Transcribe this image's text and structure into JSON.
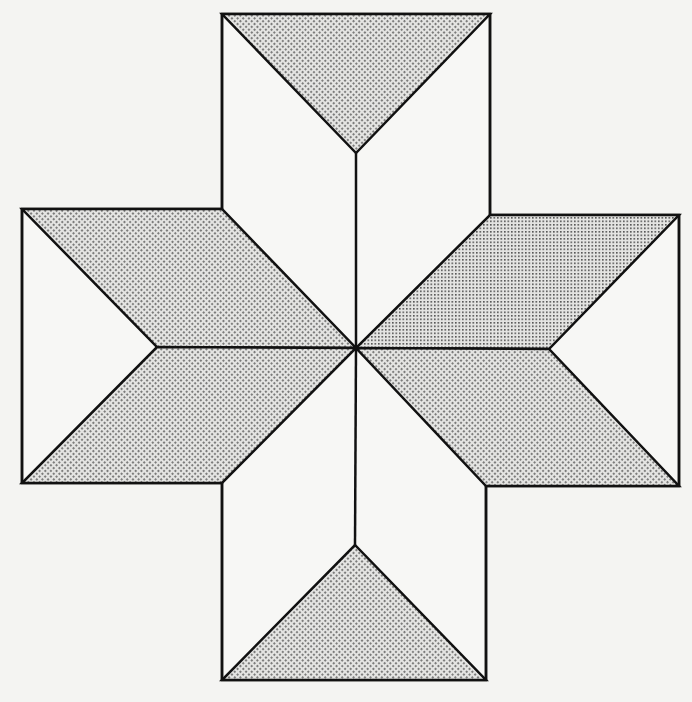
{
  "diagram": {
    "colors": {
      "background": "#f4f4f2",
      "stroke": "#111111",
      "shade_dot": "#4a4a4a",
      "shade_base": "#e6e6e4",
      "unshaded": "#f7f7f5"
    },
    "center": [
      356,
      348
    ],
    "squares": [
      {
        "name": "top",
        "x1": 222,
        "y1": 14,
        "x2": 490,
        "y2": 14
      },
      {
        "name": "left",
        "x1": 22,
        "y1": 209,
        "x2": 22,
        "y2": 483
      },
      {
        "name": "right",
        "x1": 679,
        "y1": 215,
        "x2": 679,
        "y2": 486
      },
      {
        "name": "bottom",
        "x1": 222,
        "y1": 680,
        "x2": 486,
        "y2": 680
      }
    ],
    "shaded_regions": [
      "top-triangle",
      "left-upper-rhombus",
      "left-lower-rhombus",
      "right-upper-rhombus",
      "right-lower-rhombus",
      "bottom-triangle"
    ]
  }
}
